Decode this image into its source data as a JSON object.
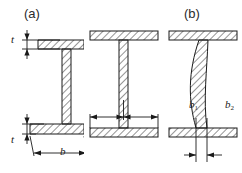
{
  "figure": {
    "background_color": "#ffffff",
    "line_color": "#1a1a1a",
    "hatch_color": "#555555",
    "panels": [
      {
        "id": "a",
        "label": "(a)",
        "description": "I-beam cross-section drawn in perspective with straight web; top and bottom flanges hatched",
        "web": "straight",
        "dimensions": [
          {
            "name": "t-top",
            "label": "t",
            "meaning": "top flange thickness"
          },
          {
            "name": "t-bottom",
            "label": "t",
            "meaning": "bottom flange thickness"
          },
          {
            "name": "b",
            "label": "b",
            "meaning": "flange width"
          }
        ]
      },
      {
        "id": "b",
        "label": "(b)",
        "description": "Symmetric I-beam cross-section with straight web; flange outstand widths marked either side of the web",
        "web": "straight",
        "dimensions": [
          {
            "name": "b1",
            "label": "b",
            "sub": "1",
            "meaning": "left flange outstand width"
          },
          {
            "name": "b2",
            "label": "b",
            "sub": "2",
            "meaning": "right flange outstand width"
          }
        ]
      },
      {
        "id": "c",
        "label": "(c)",
        "description": "I-beam cross-section with buckled (curved) web; web thickness marked at the base",
        "web": "curved",
        "dimensions": [
          {
            "name": "t",
            "label": "t",
            "meaning": "web thickness"
          }
        ]
      }
    ]
  }
}
